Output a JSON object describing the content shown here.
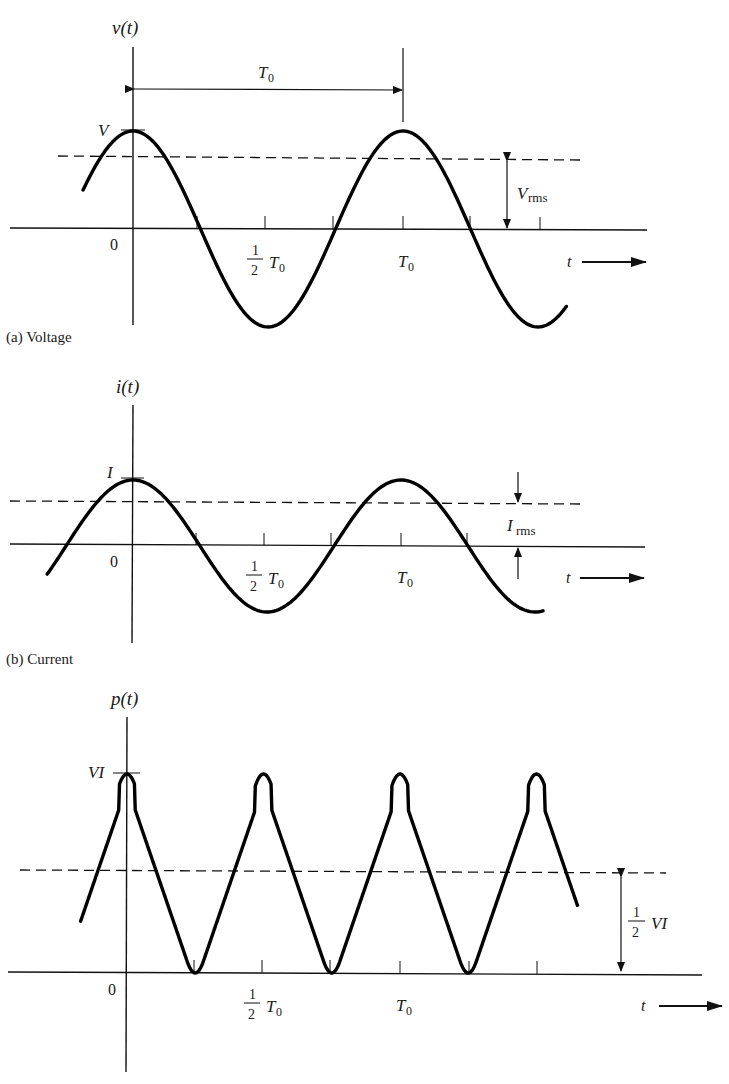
{
  "figure": {
    "panels": [
      {
        "id": "a",
        "caption": "(a) Voltage",
        "y_label": "v(t)",
        "peak_label": "V",
        "origin_label": "0",
        "half_period_label": {
          "num": "1",
          "den": "2",
          "sym": "T",
          "sub": "0"
        },
        "period_label": {
          "sym": "T",
          "sub": "0"
        },
        "period_arrow_label": {
          "sym": "T",
          "sub": "0"
        },
        "rms_label": {
          "sym": "V",
          "sub": "rms"
        },
        "t_label": "t"
      },
      {
        "id": "b",
        "caption": "(b) Current",
        "y_label": "i(t)",
        "peak_label": "I",
        "origin_label": "0",
        "half_period_label": {
          "num": "1",
          "den": "2",
          "sym": "T",
          "sub": "0"
        },
        "period_label": {
          "sym": "T",
          "sub": "0"
        },
        "rms_label": {
          "sym": "I",
          "sub": "rms"
        },
        "t_label": "t"
      },
      {
        "id": "c",
        "caption": "",
        "y_label": "p(t)",
        "peak_label": "VI",
        "origin_label": "0",
        "half_period_label": {
          "num": "1",
          "den": "2",
          "sym": "T",
          "sub": "0"
        },
        "period_label": {
          "sym": "T",
          "sub": "0"
        },
        "avg_label": {
          "num": "1",
          "den": "2",
          "sym": "VI"
        },
        "t_label": "t"
      }
    ]
  },
  "chart_data": [
    {
      "type": "line",
      "title": "(a) Voltage",
      "ylabel": "v(t)",
      "xlabel": "t",
      "function": "V cos(2πt/T0)",
      "x_ticks": [
        "0",
        "1/2 T0",
        "T0"
      ],
      "y_ticks": [
        "V"
      ],
      "reference_lines": [
        {
          "name": "V_rms",
          "value": "V/√2",
          "style": "dashed"
        }
      ],
      "annotations": [
        "T0 (period, peak to peak)",
        "V_rms"
      ],
      "x_range_periods": [
        -0.22,
        1.62
      ],
      "grid": false
    },
    {
      "type": "line",
      "title": "(b) Current",
      "ylabel": "i(t)",
      "xlabel": "t",
      "function": "I cos(2πt/T0)",
      "x_ticks": [
        "0",
        "1/2 T0",
        "T0"
      ],
      "y_ticks": [
        "I"
      ],
      "reference_lines": [
        {
          "name": "I_rms",
          "value": "I/√2",
          "style": "dashed"
        }
      ],
      "annotations": [
        "I_rms"
      ],
      "x_range_periods": [
        -0.32,
        1.55
      ],
      "grid": false
    },
    {
      "type": "line",
      "title": "",
      "ylabel": "p(t)",
      "xlabel": "t",
      "function": "VI cos²(2πt/T0)",
      "x_ticks": [
        "0",
        "1/2 T0",
        "T0"
      ],
      "y_ticks": [
        "VI"
      ],
      "reference_lines": [
        {
          "name": "average power",
          "value": "1/2 VI",
          "style": "dashed"
        }
      ],
      "annotations": [
        "1/2 VI"
      ],
      "x_range_periods": [
        -0.18,
        1.65
      ],
      "grid": false
    }
  ]
}
